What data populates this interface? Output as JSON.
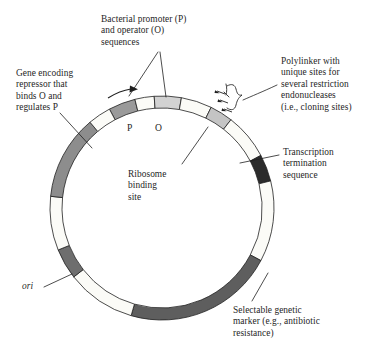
{
  "figure": {
    "type": "plasmid-map"
  },
  "annotations": {
    "promoter_operator": "Bacterial promoter (P)\nand operator (O)\nsequences",
    "polylinker": "Polylinker with\nunique sites for\nseveral restriction\nendonucleases\n(i.e., cloning sites)",
    "repressor_gene": "Gene encoding\nrepressor that\nbinds O and\nregulates P",
    "transcription_termination": "Transcription\ntermination\nsequence",
    "ribosome_binding_site": "Ribosome\nbinding\nsite",
    "selectable_marker": "Selectable genetic\nmarker (e.g., antibiotic\nresistance)",
    "origin": "ori",
    "promoter_tick": "P",
    "operator_tick": "O"
  },
  "chart_data": {
    "type": "pie",
    "center": [
      162,
      208
    ],
    "outer_radius": 112,
    "inner_radius": 100,
    "note": "Circular plasmid ring; segments listed clockwise by start angle in degrees measured clockwise from 12 o'clock.",
    "segments": [
      {
        "name": "promoter",
        "label": "P",
        "start_deg": -28,
        "end_deg": -14,
        "fill": "#9a9a9a"
      },
      {
        "name": "spacer-p-o",
        "label": "",
        "start_deg": -14,
        "end_deg": -4,
        "fill": "#fbfbf7"
      },
      {
        "name": "operator",
        "label": "O",
        "start_deg": -4,
        "end_deg": 10,
        "fill": "#d2d2d2"
      },
      {
        "name": "backbone-upper-right",
        "label": "",
        "start_deg": 10,
        "end_deg": 26,
        "fill": "#fbfbf7"
      },
      {
        "name": "ribosome-binding-site",
        "label": "",
        "start_deg": 26,
        "end_deg": 38,
        "fill": "#c4c4c4"
      },
      {
        "name": "polylinker-cloning-sites",
        "label": "",
        "start_deg": 38,
        "end_deg": 62,
        "fill": "#fbfbf7"
      },
      {
        "name": "transcription-termination",
        "label": "",
        "start_deg": 62,
        "end_deg": 76,
        "fill": "#2b2b2b"
      },
      {
        "name": "backbone-right",
        "label": "",
        "start_deg": 76,
        "end_deg": 118,
        "fill": "#fbfbf7"
      },
      {
        "name": "selectable-marker",
        "label": "",
        "start_deg": 118,
        "end_deg": 196,
        "fill": "#5e5e5e"
      },
      {
        "name": "backbone-lower-left",
        "label": "",
        "start_deg": 196,
        "end_deg": 232,
        "fill": "#fbfbf7"
      },
      {
        "name": "ori",
        "label": "ori",
        "start_deg": 232,
        "end_deg": 248,
        "fill": "#6e6e6e"
      },
      {
        "name": "backbone-left",
        "label": "",
        "start_deg": 248,
        "end_deg": 276,
        "fill": "#fbfbf7"
      },
      {
        "name": "repressor-gene",
        "label": "",
        "start_deg": 276,
        "end_deg": 320,
        "fill": "#8d8d8d"
      },
      {
        "name": "backbone-upper-left",
        "label": "",
        "start_deg": 320,
        "end_deg": 332,
        "fill": "#fbfbf7"
      }
    ],
    "markers": [
      {
        "name": "transcription-direction-arrow",
        "description": "rightward curved arrow above promoter indicating direction of transcription"
      },
      {
        "name": "polylinker-brace",
        "description": "curly brace with three arrows pointing at the polylinker region"
      }
    ]
  },
  "colors": {
    "stroke": "#1f1f1f",
    "backbone": "#fbfbf7",
    "promoter": "#9a9a9a",
    "operator": "#d2d2d2",
    "ribosome": "#c4c4c4",
    "termination": "#2b2b2b",
    "marker": "#5e5e5e",
    "ori": "#6e6e6e",
    "repressor": "#8d8d8d"
  }
}
